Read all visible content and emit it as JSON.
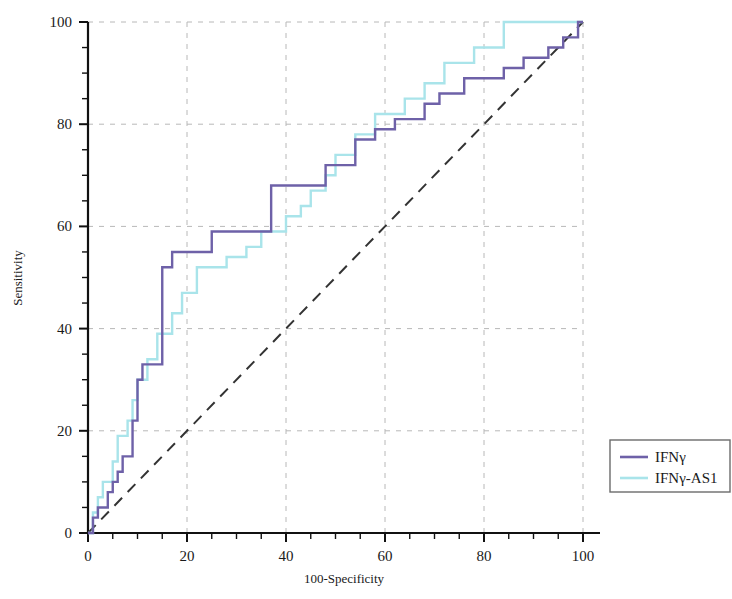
{
  "chart_data": {
    "type": "line",
    "title": "",
    "xlabel": "100-Specificity",
    "ylabel": "Sensitivity",
    "xlim": [
      0,
      100
    ],
    "ylim": [
      0,
      100
    ],
    "xticks": [
      0,
      20,
      40,
      60,
      80,
      100
    ],
    "yticks": [
      0,
      20,
      40,
      60,
      80,
      100
    ],
    "xtick_labels": [
      "0",
      "20",
      "40",
      "60",
      "80",
      "100"
    ],
    "ytick_labels": [
      "0",
      "20",
      "40",
      "60",
      "80",
      "100"
    ],
    "minor_tick_step": 5,
    "grid": true,
    "grid_style": "dashed",
    "legend_position": "right-outside",
    "reference_line": {
      "name": "diagonal",
      "style": "dashed",
      "color": "#333333",
      "x": [
        0,
        100
      ],
      "y": [
        0,
        100
      ]
    },
    "series": [
      {
        "name": "IFNγ",
        "color": "#6e61a8",
        "style": "step",
        "points": [
          [
            0,
            0
          ],
          [
            1,
            0
          ],
          [
            1,
            3
          ],
          [
            2,
            3
          ],
          [
            2,
            5
          ],
          [
            4,
            5
          ],
          [
            4,
            8
          ],
          [
            5,
            8
          ],
          [
            5,
            10
          ],
          [
            6,
            10
          ],
          [
            6,
            12
          ],
          [
            7,
            12
          ],
          [
            7,
            15
          ],
          [
            9,
            15
          ],
          [
            9,
            22
          ],
          [
            10,
            22
          ],
          [
            10,
            30
          ],
          [
            11,
            30
          ],
          [
            11,
            33
          ],
          [
            15,
            33
          ],
          [
            15,
            52
          ],
          [
            17,
            52
          ],
          [
            17,
            55
          ],
          [
            25,
            55
          ],
          [
            25,
            59
          ],
          [
            37,
            59
          ],
          [
            37,
            68
          ],
          [
            48,
            68
          ],
          [
            48,
            72
          ],
          [
            54,
            72
          ],
          [
            54,
            77
          ],
          [
            58,
            77
          ],
          [
            58,
            79
          ],
          [
            62,
            79
          ],
          [
            62,
            81
          ],
          [
            68,
            81
          ],
          [
            68,
            84
          ],
          [
            71,
            84
          ],
          [
            71,
            86
          ],
          [
            76,
            86
          ],
          [
            76,
            89
          ],
          [
            84,
            89
          ],
          [
            84,
            91
          ],
          [
            88,
            91
          ],
          [
            88,
            93
          ],
          [
            93,
            93
          ],
          [
            93,
            95
          ],
          [
            96,
            95
          ],
          [
            96,
            97
          ],
          [
            99,
            97
          ],
          [
            99,
            100
          ],
          [
            100,
            100
          ]
        ]
      },
      {
        "name": "IFNγ-AS1",
        "color": "#a9e4ea",
        "style": "step",
        "points": [
          [
            0,
            0
          ],
          [
            1,
            0
          ],
          [
            1,
            4
          ],
          [
            2,
            4
          ],
          [
            2,
            7
          ],
          [
            3,
            7
          ],
          [
            3,
            10
          ],
          [
            5,
            10
          ],
          [
            5,
            14
          ],
          [
            6,
            14
          ],
          [
            6,
            19
          ],
          [
            8,
            19
          ],
          [
            8,
            22
          ],
          [
            9,
            22
          ],
          [
            9,
            26
          ],
          [
            10,
            26
          ],
          [
            10,
            30
          ],
          [
            12,
            30
          ],
          [
            12,
            34
          ],
          [
            14,
            34
          ],
          [
            14,
            39
          ],
          [
            17,
            39
          ],
          [
            17,
            43
          ],
          [
            19,
            43
          ],
          [
            19,
            47
          ],
          [
            22,
            47
          ],
          [
            22,
            52
          ],
          [
            28,
            52
          ],
          [
            28,
            54
          ],
          [
            32,
            54
          ],
          [
            32,
            56
          ],
          [
            35,
            56
          ],
          [
            35,
            59
          ],
          [
            40,
            59
          ],
          [
            40,
            62
          ],
          [
            43,
            62
          ],
          [
            43,
            64
          ],
          [
            45,
            64
          ],
          [
            45,
            67
          ],
          [
            48,
            67
          ],
          [
            48,
            70
          ],
          [
            50,
            70
          ],
          [
            50,
            74
          ],
          [
            54,
            74
          ],
          [
            54,
            78
          ],
          [
            58,
            78
          ],
          [
            58,
            82
          ],
          [
            64,
            82
          ],
          [
            64,
            85
          ],
          [
            68,
            85
          ],
          [
            68,
            88
          ],
          [
            72,
            88
          ],
          [
            72,
            92
          ],
          [
            78,
            92
          ],
          [
            78,
            95
          ],
          [
            84,
            95
          ],
          [
            84,
            100
          ],
          [
            100,
            100
          ]
        ]
      }
    ],
    "legend_entries": [
      {
        "label": "IFNγ",
        "color": "#6e61a8"
      },
      {
        "label": "IFNγ-AS1",
        "color": "#a9e4ea"
      }
    ]
  },
  "colors": {
    "series_1": "#6e61a8",
    "series_2": "#a9e4ea",
    "axis": "#111111",
    "grid": "#b8b8b8",
    "reference": "#333333",
    "background": "#ffffff",
    "legend_border": "#6b6b6b"
  }
}
